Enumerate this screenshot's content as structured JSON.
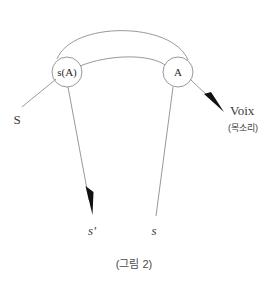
{
  "figure": {
    "caption": "(그림 2)",
    "background_color": "#ffffff",
    "line_color": "#8c8c8c",
    "text_color": "#3a3a3a",
    "arrow_color": "#111111"
  },
  "nodes": [
    {
      "id": "left-node",
      "label": "s(A)",
      "cx": 67,
      "cy": 72,
      "r": 15
    },
    {
      "id": "right-node",
      "label": "A",
      "cx": 178,
      "cy": 72,
      "r": 15
    }
  ],
  "labels": {
    "input_left": "S",
    "output_left": "s'",
    "output_right": "s",
    "output_voice": "Voix",
    "output_voice_korean": "(목소리)"
  },
  "edges": [
    {
      "id": "outer-arc",
      "from": "left-node",
      "to": "right-node",
      "kind": "arc",
      "arrowhead": false
    },
    {
      "id": "inner-arc",
      "from": "left-node",
      "to": "right-node",
      "kind": "arc",
      "arrowhead": false
    },
    {
      "id": "input-curve",
      "from": "input-S",
      "to": "left-node",
      "kind": "curve",
      "arrowhead": false
    },
    {
      "id": "left-output-arrow",
      "from": "left-node",
      "to": "output-s-prime",
      "kind": "line",
      "arrowhead": true
    },
    {
      "id": "right-output-line",
      "from": "right-node",
      "to": "output-s",
      "kind": "line",
      "arrowhead": false
    },
    {
      "id": "voice-arrow",
      "from": "right-node",
      "to": "output-voix",
      "kind": "curve",
      "arrowhead": true
    }
  ]
}
